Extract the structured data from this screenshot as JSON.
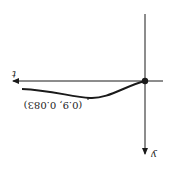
{
  "diagram": {
    "orientation": "rotated-180",
    "axes": {
      "horizontal_label": "t",
      "vertical_label": "y"
    },
    "point_label": "(0.9, 0.083)",
    "colors": {
      "ink": "#1a1a1a",
      "background": "#ffffff"
    }
  }
}
